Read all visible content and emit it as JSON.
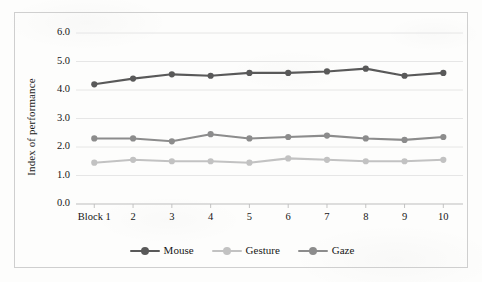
{
  "chart_data": {
    "type": "line",
    "title": "",
    "xlabel": "",
    "ylabel": "Index of performance",
    "ylim": [
      0.0,
      6.0
    ],
    "ytick_labels": [
      "0.0",
      "1.0",
      "2.0",
      "3.0",
      "4.0",
      "5.0",
      "6.0"
    ],
    "ytick_values": [
      0.0,
      1.0,
      2.0,
      3.0,
      4.0,
      5.0,
      6.0
    ],
    "grid": true,
    "grid_axis": "y",
    "legend_position": "bottom-center",
    "categories": [
      "Block 1",
      "2",
      "3",
      "4",
      "5",
      "6",
      "7",
      "8",
      "9",
      "10"
    ],
    "x": [
      1,
      2,
      3,
      4,
      5,
      6,
      7,
      8,
      9,
      10
    ],
    "series": [
      {
        "name": "Mouse",
        "color": "#595959",
        "values": [
          4.2,
          4.4,
          4.55,
          4.5,
          4.6,
          4.6,
          4.65,
          4.75,
          4.5,
          4.6
        ]
      },
      {
        "name": "Gesture",
        "color": "#c2c2c2",
        "values": [
          1.45,
          1.55,
          1.5,
          1.5,
          1.45,
          1.6,
          1.55,
          1.5,
          1.5,
          1.55
        ]
      },
      {
        "name": "Gaze",
        "color": "#8c8c8c",
        "values": [
          2.3,
          2.3,
          2.2,
          2.45,
          2.3,
          2.35,
          2.4,
          2.3,
          2.25,
          2.35
        ]
      }
    ]
  },
  "figure": {
    "border_color": "#cfcfcf",
    "gridline_color": "#e3e3e3",
    "axis_color": "#bdbdbd",
    "background": "#fdfdfc"
  },
  "legend": {
    "items": [
      {
        "label": "Mouse"
      },
      {
        "label": "Gesture"
      },
      {
        "label": "Gaze"
      }
    ]
  }
}
